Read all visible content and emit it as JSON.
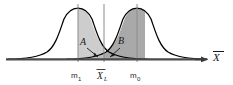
{
  "figure": {
    "type": "statistics-distribution-diagram",
    "axis": {
      "x_axis_label": "X",
      "x_axis_label_overbar": true,
      "arrow": "right-arrow"
    },
    "tick_labels": [
      {
        "id": "mu1",
        "text": "m",
        "subscript": "1",
        "x": 78
      },
      {
        "id": "xbar_L",
        "text": "X",
        "subscript": "L",
        "overbar": true,
        "x": 104
      },
      {
        "id": "mu0",
        "text": "m",
        "subscript": "0",
        "x": 137
      }
    ],
    "region_labels": [
      {
        "id": "region-a",
        "text": "A",
        "x": 84,
        "y": 44
      },
      {
        "id": "region-b",
        "text": "B",
        "x": 120,
        "y": 43
      }
    ],
    "curves": [
      {
        "id": "left-curve",
        "mean": 78,
        "peak_y": 8,
        "baseline_y": 59
      },
      {
        "id": "right-curve",
        "mean": 137,
        "peak_y": 8,
        "baseline_y": 59
      }
    ],
    "shaded_regions": [
      {
        "id": "region-a-shade",
        "fill": "#c9c9c9",
        "from": "left-tail",
        "to": "threshold"
      },
      {
        "id": "region-b-shade",
        "fill": "#a8a8a8",
        "from": "threshold",
        "to": "right-tail"
      }
    ],
    "colors": {
      "curve_stroke": "#000000",
      "axis_stroke": "#5a5a5a",
      "vertical_line": "#8c8c8c",
      "region_a_fill": "#cdcdcd",
      "region_b_fill": "#a9a9a9",
      "background": "#ffffff",
      "text": "#1a1a1a"
    }
  }
}
